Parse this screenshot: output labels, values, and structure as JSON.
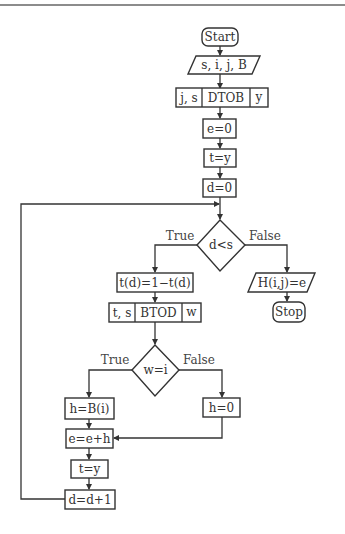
{
  "diagram": {
    "type": "flowchart",
    "nodes": {
      "start": {
        "label": "Start",
        "shape": "terminator"
      },
      "input": {
        "label": "s, i, j, B",
        "shape": "io"
      },
      "dtob": {
        "left": "j, s",
        "center": "DTOB",
        "right": "y",
        "shape": "subroutine"
      },
      "e0": {
        "label": "e=0",
        "shape": "process"
      },
      "ty1": {
        "label": "t=y",
        "shape": "process"
      },
      "d0": {
        "label": "d=0",
        "shape": "process"
      },
      "dlts": {
        "label": "d<s",
        "shape": "decision"
      },
      "flip": {
        "label": "t(d)=1−t(d)",
        "shape": "process"
      },
      "btod": {
        "left": "t, s",
        "center": "BTOD",
        "right": "w",
        "shape": "subroutine"
      },
      "weqi": {
        "label": "w=i",
        "shape": "decision"
      },
      "hbi": {
        "label": "h=B(i)",
        "shape": "process"
      },
      "h0": {
        "label": "h=0",
        "shape": "process"
      },
      "eeh": {
        "label": "e=e+h",
        "shape": "process"
      },
      "ty2": {
        "label": "t=y",
        "shape": "process"
      },
      "dinc": {
        "label": "d=d+1",
        "shape": "process"
      },
      "output": {
        "label": "H(i,j)=e",
        "shape": "io"
      },
      "stop": {
        "label": "Stop",
        "shape": "terminator"
      }
    },
    "edge_labels": {
      "dlts_true": "True",
      "dlts_false": "False",
      "weqi_true": "True",
      "weqi_false": "False"
    },
    "edges": [
      [
        "start",
        "input"
      ],
      [
        "input",
        "dtob"
      ],
      [
        "dtob",
        "e0"
      ],
      [
        "e0",
        "ty1"
      ],
      [
        "ty1",
        "d0"
      ],
      [
        "d0",
        "dlts"
      ],
      [
        "dlts",
        "flip",
        "True"
      ],
      [
        "dlts",
        "output",
        "False"
      ],
      [
        "flip",
        "btod"
      ],
      [
        "btod",
        "weqi"
      ],
      [
        "weqi",
        "hbi",
        "True"
      ],
      [
        "weqi",
        "h0",
        "False"
      ],
      [
        "hbi",
        "eeh"
      ],
      [
        "h0",
        "eeh"
      ],
      [
        "eeh",
        "ty2"
      ],
      [
        "ty2",
        "dinc"
      ],
      [
        "dinc",
        "dlts"
      ],
      [
        "output",
        "stop"
      ]
    ]
  }
}
